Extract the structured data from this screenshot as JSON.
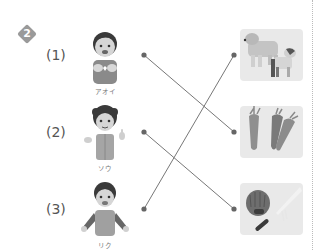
{
  "exercise": {
    "number": "2",
    "questions": [
      {
        "label": "(1)",
        "name": "アオイ"
      },
      {
        "label": "(2)",
        "name": "ソウ"
      },
      {
        "label": "(3)",
        "name": "リク"
      }
    ],
    "pictures": [
      {
        "name": "dogs"
      },
      {
        "name": "carrots"
      },
      {
        "name": "baseball-glove-and-bat"
      }
    ],
    "connections": [
      {
        "from": 1,
        "to": 2
      },
      {
        "from": 2,
        "to": 3
      },
      {
        "from": 3,
        "to": 1
      }
    ]
  },
  "colors": {
    "line": "#777777",
    "dot": "#666666",
    "badge": "#9a9a9a",
    "panel": "#e9e9e9"
  }
}
